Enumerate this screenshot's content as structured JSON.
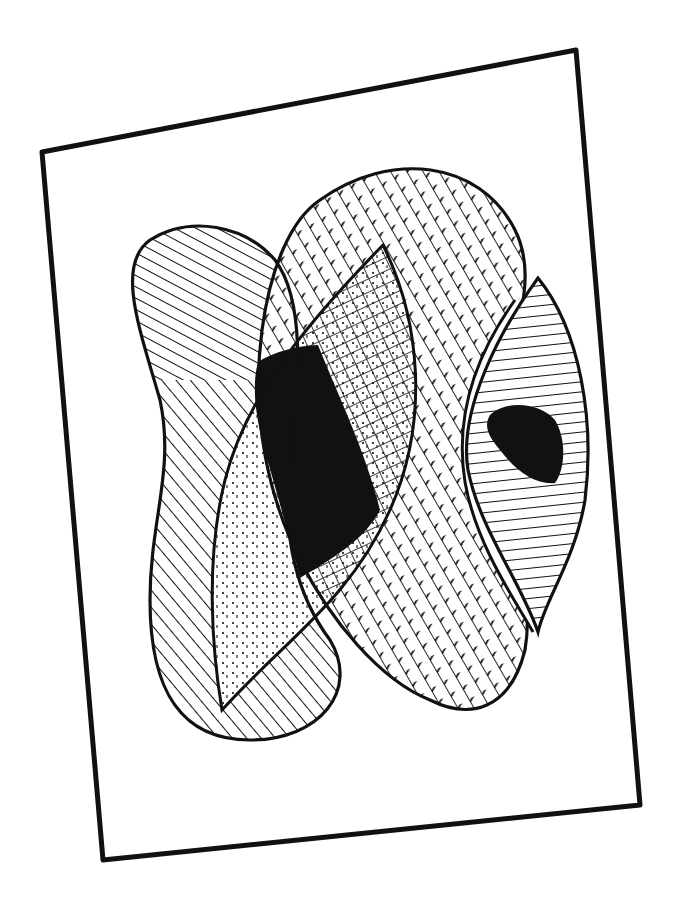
{
  "artwork": {
    "description": "Black-and-white ink drawing of overlapping abstract hatched shapes inside a tilted rectangular frame",
    "colors": {
      "ink": "#111111",
      "paper": "#ffffff"
    },
    "frame": {
      "corners": [
        [
          42,
          152
        ],
        [
          576,
          50
        ],
        [
          640,
          805
        ],
        [
          103,
          860
        ]
      ]
    },
    "shapes": [
      {
        "name": "left-lobe",
        "fill": "diagonal-line-hatch"
      },
      {
        "name": "center-oval",
        "fill": "cross-hatch"
      },
      {
        "name": "leaf-shape",
        "fill": "dotted-stipple"
      },
      {
        "name": "central-black-region",
        "fill": "solid-black"
      },
      {
        "name": "right-eye-shape",
        "fill": "horizontal-line-hatch"
      },
      {
        "name": "eye-pupil",
        "fill": "solid-black"
      }
    ]
  }
}
